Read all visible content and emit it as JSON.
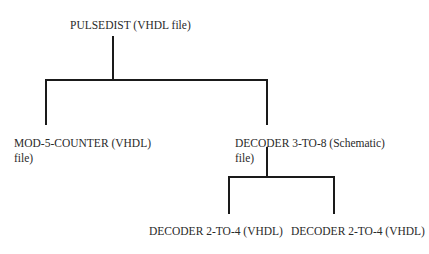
{
  "diagram": {
    "root": {
      "label": "PULSEDIST (VHDL file)"
    },
    "level1": [
      {
        "label_line1": "MOD-5-COUNTER (VHDL)",
        "label_line2": "file)"
      },
      {
        "label_line1": "DECODER 3-TO-8  (Schematic)",
        "label_line2": "file)"
      }
    ],
    "level2": [
      {
        "label": "DECODER 2-TO-4 (VHDL)"
      },
      {
        "label": "DECODER 2-TO-4 (VHDL)"
      }
    ],
    "line_color": "#1a1a1a"
  }
}
